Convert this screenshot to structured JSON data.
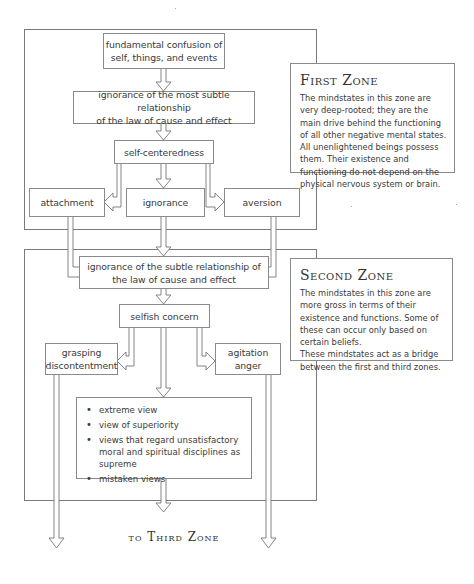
{
  "zones": [
    {
      "id": "first",
      "title": "First Zone",
      "description": [
        "The mindstates in this zone are very deep-rooted; they are the main drive behind the functioning of all other negative mental states.",
        "All unenlightened beings possess them. Their existence and functioning do not depend on the physical nervous system or brain."
      ]
    },
    {
      "id": "second",
      "title": "Second Zone",
      "description": [
        "The mindstates in this zone are more gross in terms of their existence and functions. Some of these can occur only based on certain beliefs.",
        "These mindstates act as a bridge between the first and third zones."
      ]
    }
  ],
  "nodes": {
    "fundamental_confusion": [
      "fundamental confusion of",
      "self, things, and events"
    ],
    "ignorance_most_subtle": [
      "ignorance of the most subtle relationship",
      "of the law of cause and effect"
    ],
    "self_centeredness": [
      "self-centeredness"
    ],
    "attachment": [
      "attachment"
    ],
    "ignorance": [
      "ignorance"
    ],
    "aversion": [
      "aversion"
    ],
    "ignorance_subtle": [
      "ignorance of the subtle relationship of",
      "the law of cause and effect"
    ],
    "selfish_concern": [
      "selfish concern"
    ],
    "grasping": [
      "grasping",
      "discontentment"
    ],
    "agitation": [
      "agitation",
      "anger"
    ]
  },
  "views_list": [
    "extreme view",
    "view of superiority",
    "views that regard unsatisfactory moral and spiritual disciplines as supreme",
    "mistaken views"
  ],
  "footer": "to Third Zone",
  "colors": {
    "line": "#777777",
    "text": "#333333",
    "background": "#ffffff"
  }
}
